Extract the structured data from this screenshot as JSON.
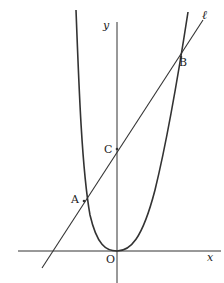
{
  "figure": {
    "colors": {
      "stroke": "#333333",
      "background": "#ffffff",
      "text": "#222222"
    }
  },
  "axes": {
    "x_label": "x",
    "y_label": "y",
    "origin_label": "O"
  },
  "curves": {
    "parabola": {
      "name": "parabola"
    },
    "line": {
      "name": "ℓ",
      "label": "ℓ"
    }
  },
  "points": {
    "A": {
      "label": "A"
    },
    "B": {
      "label": "B"
    },
    "C": {
      "label": "C"
    },
    "O": {
      "label": "O"
    }
  }
}
